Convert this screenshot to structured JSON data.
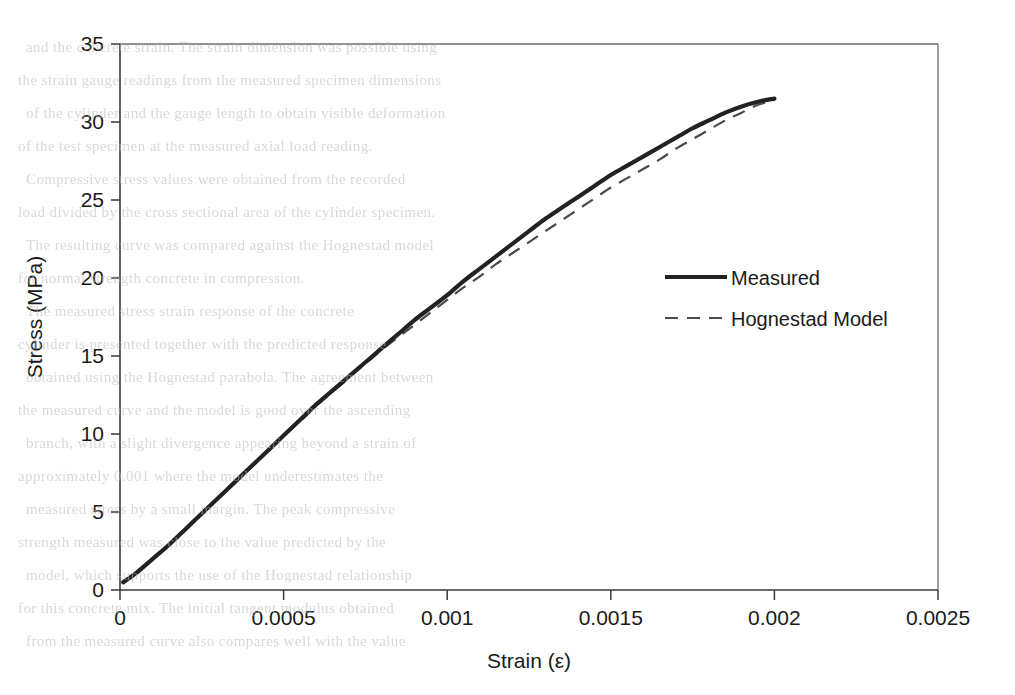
{
  "page": {
    "background_color": "#ffffff",
    "ink_color": "#1a1a1a",
    "scan_bleed_text": [
      "                 ",
      "and the concrete strain. The strain dimension was possible using",
      "the strain gauge readings from the measured specimen dimensions",
      "of the cylinder and the gauge length to obtain visible deformation",
      "of the test specimen at the measured axial load reading.",
      "Compressive stress values were obtained from the recorded",
      "load divided by the cross sectional area of the cylinder specimen.",
      "The resulting curve was compared against the Hognestad model",
      "for normal strength concrete in compression.",
      "The measured stress strain response of the concrete",
      "cylinder is presented together with the predicted response",
      "obtained using the Hognestad parabola. The agreement between",
      "the measured curve and the model is good over the ascending",
      "branch, with a slight divergence appearing beyond a strain of",
      "approximately 0.001 where the model underestimates the",
      "measured stress by a small margin. The peak compressive",
      "strength measured was close to the value predicted by the",
      "model, which supports the use of the Hognestad relationship",
      "for this concrete mix. The initial tangent modulus obtained",
      "from the measured curve also compares well with the value"
    ]
  },
  "chart_data": {
    "type": "line",
    "title": "",
    "xlabel": "Strain (ε)",
    "ylabel": "Stress (MPa)",
    "xlim": [
      0,
      0.0025
    ],
    "ylim": [
      0,
      35
    ],
    "xticks": [
      0,
      0.0005,
      0.001,
      0.0015,
      0.002,
      0.0025
    ],
    "xticklabels": [
      "0",
      "0.0005",
      "0.001",
      "0.0015",
      "0.002",
      "0.0025"
    ],
    "yticks": [
      0,
      5,
      10,
      15,
      20,
      25,
      30,
      35
    ],
    "yticklabels": [
      "0",
      "5",
      "10",
      "15",
      "20",
      "25",
      "30",
      "35"
    ],
    "grid": false,
    "legend_position": "inside upper-right",
    "series": [
      {
        "name": "Measured",
        "style": "solid",
        "color": "#222222",
        "x": [
          1e-05,
          5e-05,
          0.0001,
          0.00015,
          0.0002,
          0.00025,
          0.0003,
          0.00035,
          0.0004,
          0.00045,
          0.0005,
          0.00055,
          0.0006,
          0.00065,
          0.0007,
          0.00075,
          0.0008,
          0.00085,
          0.0009,
          0.00095,
          0.001,
          0.00105,
          0.0011,
          0.00115,
          0.0012,
          0.00125,
          0.0013,
          0.00135,
          0.0014,
          0.00145,
          0.0015,
          0.00155,
          0.0016,
          0.00165,
          0.0017,
          0.00175,
          0.0018,
          0.00185,
          0.0019,
          0.00195,
          0.002
        ],
        "y": [
          0.5,
          1.1,
          2.0,
          2.9,
          3.9,
          4.9,
          5.9,
          6.9,
          7.9,
          8.9,
          9.9,
          10.9,
          11.9,
          12.8,
          13.7,
          14.6,
          15.5,
          16.4,
          17.3,
          18.1,
          18.9,
          19.8,
          20.6,
          21.4,
          22.2,
          23.0,
          23.8,
          24.5,
          25.2,
          25.9,
          26.6,
          27.2,
          27.8,
          28.4,
          29.0,
          29.6,
          30.1,
          30.6,
          31.0,
          31.3,
          31.5
        ]
      },
      {
        "name": "Hognestad Model",
        "style": "dashed",
        "color": "#4a4a4a",
        "x": [
          1e-05,
          5e-05,
          0.0001,
          0.00015,
          0.0002,
          0.00025,
          0.0003,
          0.00035,
          0.0004,
          0.00045,
          0.0005,
          0.00055,
          0.0006,
          0.00065,
          0.0007,
          0.00075,
          0.0008,
          0.00085,
          0.0009,
          0.00095,
          0.001,
          0.00105,
          0.0011,
          0.00115,
          0.0012,
          0.00125,
          0.0013,
          0.00135,
          0.0014,
          0.00145,
          0.0015,
          0.00155,
          0.0016,
          0.00165,
          0.0017,
          0.00175,
          0.0018,
          0.00185,
          0.0019,
          0.00195,
          0.002
        ],
        "y": [
          0.5,
          1.1,
          2.0,
          2.9,
          3.9,
          4.9,
          5.9,
          6.9,
          7.9,
          8.9,
          9.9,
          10.8,
          11.8,
          12.7,
          13.6,
          14.5,
          15.4,
          16.2,
          17.0,
          17.8,
          18.6,
          19.4,
          20.1,
          20.9,
          21.6,
          22.3,
          23.0,
          23.7,
          24.4,
          25.1,
          25.8,
          26.4,
          27.0,
          27.6,
          28.3,
          28.9,
          29.5,
          30.1,
          30.6,
          31.1,
          31.4
        ]
      }
    ]
  }
}
